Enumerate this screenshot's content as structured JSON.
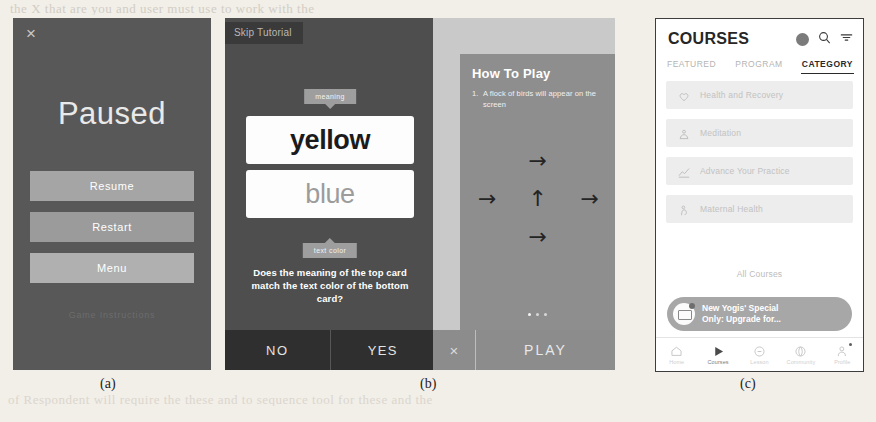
{
  "page": {
    "bleed_top": "the X that are you and user must use to work with the",
    "bleed_bottom": "of Respondent will require the these and to sequence tool for these and the"
  },
  "captions": {
    "a": "(a)",
    "b": "(b)",
    "c": "(c)"
  },
  "panel_a": {
    "name": "paused-dialog",
    "close_icon": "×",
    "title": "Paused",
    "buttons": [
      {
        "id": "resume",
        "label": "Resume"
      },
      {
        "id": "restart",
        "label": "Restart"
      },
      {
        "id": "menu",
        "label": "Menu"
      }
    ],
    "footer_link": "Game Instructions",
    "colors": {
      "background": "#585858",
      "button": "#a5a5a5",
      "text": "#ffffff"
    }
  },
  "panel_b": {
    "name": "stroop-tutorial",
    "skip_label": "Skip Tutorial",
    "tooltip_top": "meaning",
    "tooltip_bottom": "text color",
    "card_top": {
      "word": "yellow",
      "ink": "#1b1b1b"
    },
    "card_bottom": {
      "word": "blue",
      "ink": "#9c9c9c"
    },
    "question": "Does the meaning of the top card match the text color of the bottom card?",
    "answers": [
      {
        "id": "no",
        "label": "NO"
      },
      {
        "id": "yes",
        "label": "YES"
      }
    ],
    "colors": {
      "background": "#4e4e4e",
      "answer_bar": "#2f2f2f",
      "tooltip": "#9e9e9e"
    }
  },
  "panel_b2": {
    "name": "how-to-play-overlay",
    "title": "How To Play",
    "step_number": "1.",
    "step_text": "A flock of birds will appear on the screen",
    "arrows": [
      {
        "position": "top",
        "glyph": "→",
        "direction": "right"
      },
      {
        "position": "left",
        "glyph": "→",
        "direction": "right"
      },
      {
        "position": "middle",
        "glyph": "↑",
        "direction": "up"
      },
      {
        "position": "right",
        "glyph": "→",
        "direction": "right"
      },
      {
        "position": "bottom",
        "glyph": "→",
        "direction": "right"
      }
    ],
    "pager": {
      "total": 3,
      "active_index": 0
    },
    "close_icon": "×",
    "play_label": "PLAY",
    "colors": {
      "sheet": "#8e8e8e",
      "backdrop": "#c9c9c9",
      "bar": "#8c8c8c"
    }
  },
  "panel_c": {
    "name": "courses-app",
    "header": {
      "title": "COURSES",
      "icons": [
        {
          "name": "avatar",
          "glyph": ""
        },
        {
          "name": "search-icon",
          "glyph": "⌕"
        },
        {
          "name": "filter-icon",
          "glyph": "≡"
        }
      ]
    },
    "tabs": [
      {
        "label": "FEATURED",
        "active": false
      },
      {
        "label": "PROGRAM",
        "active": false
      },
      {
        "label": "CATEGORY",
        "active": true
      }
    ],
    "categories": [
      {
        "label": "Health and Recovery",
        "icon": "heart-icon"
      },
      {
        "label": "Meditation",
        "icon": "meditation-icon"
      },
      {
        "label": "Advance Your Practice",
        "icon": "chart-icon"
      },
      {
        "label": "Maternal Health",
        "icon": "maternal-icon"
      }
    ],
    "all_courses_label": "All Courses",
    "toast": {
      "icon": "envelope-icon",
      "line1": "New Yogis' Special",
      "line2": "Only: Upgrade for..."
    },
    "bottom_nav": [
      {
        "label": "Home",
        "icon": "home-icon",
        "active": false,
        "badge": false
      },
      {
        "label": "Courses",
        "icon": "play-icon",
        "active": true,
        "badge": false
      },
      {
        "label": "Lesson",
        "icon": "clock-icon",
        "active": false,
        "badge": false
      },
      {
        "label": "Community",
        "icon": "globe-icon",
        "active": false,
        "badge": false
      },
      {
        "label": "Profile",
        "icon": "profile-icon",
        "active": false,
        "badge": true
      }
    ],
    "colors": {
      "background": "#ffffff",
      "row": "#ededed",
      "toast": "#a7a7a7",
      "accent": "#2a2a2a"
    }
  }
}
